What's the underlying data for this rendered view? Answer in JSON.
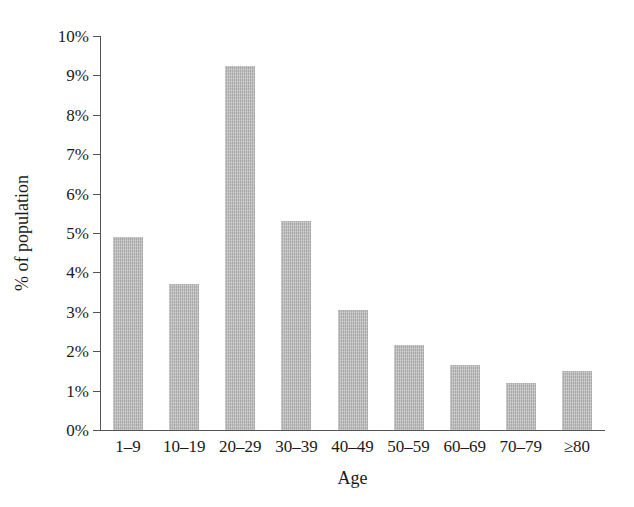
{
  "chart_data": {
    "type": "bar",
    "title": "",
    "xlabel": "Age",
    "ylabel": "% of population",
    "categories": [
      "1–9",
      "10–19",
      "20–29",
      "30–39",
      "40–49",
      "50–59",
      "60–69",
      "70–79",
      "≥80"
    ],
    "values": [
      4.9,
      3.7,
      9.25,
      5.3,
      3.05,
      2.15,
      1.65,
      1.2,
      1.5
    ],
    "value_unit": "%",
    "ylim": [
      0,
      10
    ],
    "ytick_values": [
      0,
      1,
      2,
      3,
      4,
      5,
      6,
      7,
      8,
      9,
      10
    ],
    "ytick_labels": [
      "0%",
      "1%",
      "2%",
      "3%",
      "4%",
      "5%",
      "6%",
      "7%",
      "8%",
      "9%",
      "10%"
    ],
    "grid": false,
    "legend": false,
    "legend_position": "none",
    "bar_color": "#b9b9b9",
    "axis_color": "#555555",
    "text_color": "#1a1a1a",
    "background_color": "#ffffff"
  }
}
